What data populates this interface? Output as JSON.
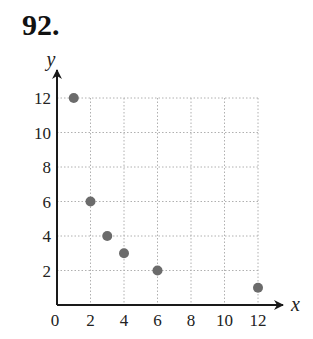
{
  "problem": {
    "number_label": "92."
  },
  "chart_data": {
    "type": "scatter",
    "title": "",
    "xlabel": "x",
    "ylabel": "y",
    "xlim": [
      0,
      12
    ],
    "ylim": [
      0,
      12
    ],
    "grid": true,
    "grid_style": "dotted",
    "x_ticks": [
      0,
      2,
      4,
      6,
      8,
      10,
      12
    ],
    "y_ticks": [
      2,
      4,
      6,
      8,
      10,
      12
    ],
    "x_tick_labels": [
      "0",
      "2",
      "4",
      "6",
      "8",
      "10",
      "12"
    ],
    "y_tick_labels": [
      "2",
      "4",
      "6",
      "8",
      "10",
      "12"
    ],
    "points": [
      {
        "x": 1,
        "y": 12
      },
      {
        "x": 2,
        "y": 6
      },
      {
        "x": 3,
        "y": 4
      },
      {
        "x": 4,
        "y": 3
      },
      {
        "x": 6,
        "y": 2
      },
      {
        "x": 12,
        "y": 1
      }
    ],
    "x": [
      1,
      2,
      3,
      4,
      6,
      12
    ],
    "values": [
      12,
      6,
      4,
      3,
      2,
      1
    ],
    "legend": [],
    "colors": {
      "point": "#6b6b6b",
      "axis": "#1a1a1a",
      "grid": "#b0b0b0"
    }
  }
}
